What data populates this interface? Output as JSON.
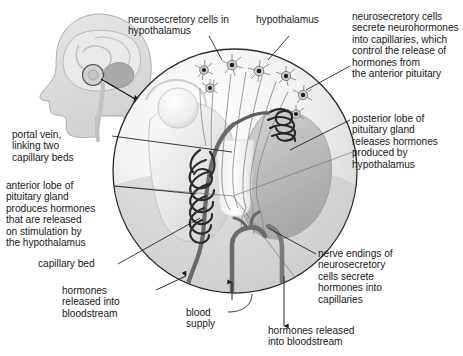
{
  "figure": {
    "background_color": "#ffffff",
    "text_color": "#1a1a1a",
    "outline_color": "#2b2b2b",
    "vessel_color": "#6e6e6e",
    "capillary_color": "#333333"
  },
  "inset": {
    "name": "head-profile-inset",
    "description": "side view of human head with brain, cerebellum and pituitary highlighted",
    "fill": "#d9d9d9",
    "stroke": "#9a9a9a"
  },
  "labels": {
    "neurosecretory_cells_in_hypothalamus": "neurosecretory cells in\nhypothalamus",
    "hypothalamus": "hypothalamus",
    "secrete_neurohormones": "neurosecretory cells\nsecrete neurohormones\ninto capillaries, which\ncontrol the release of\nhormones from\nthe anterior pituitary",
    "posterior_lobe": "posterior lobe of\npituitary gland\nreleases hormones\nproduced by\nhypothalamus",
    "portal_vein": "portal vein,\nlinking two\ncapillary beds",
    "anterior_lobe": "anterior lobe of\npituitary gland\nproduces hormones\nthat are released\non stimulation by\nthe hypothalamus",
    "capillary_bed": "capillary bed",
    "hormones_released_left": "hormones\nreleased into\nbloodstream",
    "blood_supply": "blood\nsupply",
    "nerve_endings": "nerve endings of\nneurosecretory\ncells secrete\nhormones into\ncapillaries",
    "hormones_released_right": "hormones released\ninto bloodstream"
  },
  "structures": [
    {
      "name": "main-circle",
      "shape": "circle",
      "cx": 235,
      "cy": 171,
      "r": 122
    },
    {
      "name": "hypothalamus-region",
      "note": "upper portion of circle containing star-shaped neurosecretory cells"
    },
    {
      "name": "anterior-pituitary-lobe",
      "note": "left lower lobe, light grey gradient"
    },
    {
      "name": "posterior-pituitary-lobe",
      "note": "right lower lobe, mid grey gradient"
    },
    {
      "name": "upper-capillary-bed",
      "note": "coiled dark capillary network near median eminence"
    },
    {
      "name": "lower-capillary-bed",
      "note": "coiled dark capillary network in anterior lobe"
    },
    {
      "name": "portal-vein",
      "note": "vessel linking two capillary beds"
    },
    {
      "name": "neurosecretory-cells",
      "count": 7,
      "note": "star shaped neurons with dark nuclei and radiating axons"
    },
    {
      "name": "blood-supply-vessels",
      "note": "artery and veins entering and leaving below the gland"
    }
  ]
}
